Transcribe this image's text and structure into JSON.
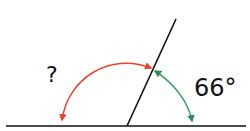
{
  "diagram": {
    "type": "angles-on-a-straight-line",
    "unknown_angle_label": "?",
    "known_angle_label": "66°",
    "known_angle_value": 66,
    "colors": {
      "line": "#111111",
      "unknown_arc": "#e8442a",
      "known_arc": "#3aa76a"
    }
  }
}
